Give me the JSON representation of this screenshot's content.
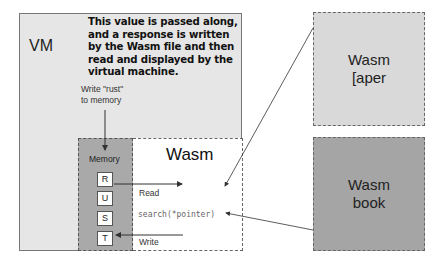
{
  "diagram": {
    "vm": {
      "label": "VM",
      "note": "This value is passed along, and a response is written by the Wasm file and then read and displayed by the virtual machine.",
      "write_label_line1": "Write \"rust\"",
      "write_label_line2": "to memory"
    },
    "memory": {
      "label": "Memory",
      "cells": [
        "R",
        "U",
        "S",
        "T"
      ]
    },
    "wasm": {
      "label": "Wasm",
      "read_label": "Read",
      "write_label": "Write",
      "code": "search(*pointer)"
    },
    "right_boxes": [
      {
        "line1": "Wasm",
        "line2": "[aper",
        "fill": "#d9d9d9"
      },
      {
        "line1": "Wasm",
        "line2": "book",
        "fill": "#a5a5a5"
      }
    ],
    "colors": {
      "vm_bg": "#e6e6e6",
      "memory_bg": "#a9a9a9",
      "wasm_bg": "#ffffff",
      "arrow": "#333333"
    }
  }
}
